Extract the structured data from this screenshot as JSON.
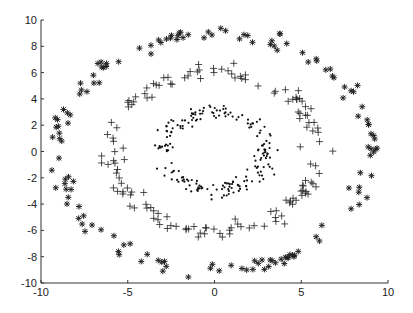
{
  "chart_data": {
    "type": "scatter",
    "title": "",
    "xlabel": "",
    "ylabel": "",
    "xlim": [
      -10,
      10
    ],
    "ylim": [
      -10,
      10
    ],
    "grid": false,
    "legend": null,
    "x_ticks": [
      "-10",
      "-5",
      "0",
      "5",
      "10"
    ],
    "y_ticks": [
      "10",
      "8",
      "6",
      "4",
      "2",
      "0",
      "-2",
      "-4",
      "-6",
      "-8",
      "-10"
    ],
    "series": [
      {
        "name": "inner ring",
        "marker": "dot",
        "radius": 3,
        "noise": 0.3,
        "count": 200,
        "color": "#111111"
      },
      {
        "name": "middle ring",
        "marker": "plus",
        "radius": 6,
        "noise": 0.3,
        "count": 150,
        "color": "#222222"
      },
      {
        "name": "outer ring",
        "marker": "asterisk",
        "radius": 9,
        "noise": 0.3,
        "count": 150,
        "color": "#222222"
      }
    ]
  }
}
